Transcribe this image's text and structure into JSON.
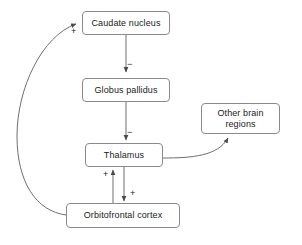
{
  "diagram": {
    "background_color": "#ffffff",
    "line_color": "#6f6f6f",
    "box_border_color": "#8a8a8a",
    "text_color": "#1a1a1a",
    "nodes": [
      {
        "id": "caudate",
        "label": "Caudate nucleus",
        "x": 82,
        "y": 11,
        "w": 88,
        "h": 24
      },
      {
        "id": "globus",
        "label": "Globus pallidus",
        "x": 82,
        "y": 78,
        "w": 88,
        "h": 24
      },
      {
        "id": "thalamus",
        "label": "Thalamus",
        "x": 85,
        "y": 143,
        "w": 78,
        "h": 24
      },
      {
        "id": "other_brain",
        "label": "Other brain\nregions",
        "x": 201,
        "y": 103,
        "w": 79,
        "h": 31
      },
      {
        "id": "orbitofrontal",
        "label": "Orbitofrontal cortex",
        "x": 66,
        "y": 203,
        "w": 114,
        "h": 25
      }
    ],
    "edges": [
      {
        "id": "caudate-to-globus",
        "from": "caudate",
        "to": "globus",
        "sign": "−",
        "sign_x": 127,
        "sign_y": 60
      },
      {
        "id": "globus-to-thalamus",
        "from": "globus",
        "to": "thalamus",
        "sign": "−",
        "sign_x": 127,
        "sign_y": 128
      },
      {
        "id": "orbitofrontal-to-thalamus",
        "from": "orbitofrontal",
        "to": "thalamus",
        "sign": "+",
        "sign_x": 103,
        "sign_y": 170
      },
      {
        "id": "thalamus-to-orbitofrontal",
        "from": "thalamus",
        "to": "orbitofrontal",
        "sign": "+",
        "sign_x": 130,
        "sign_y": 189
      },
      {
        "id": "orbitofrontal-to-caudate",
        "from": "orbitofrontal",
        "to": "caudate",
        "sign": "+",
        "sign_x": 71,
        "sign_y": 27
      },
      {
        "id": "thalamus-to-other-brain",
        "from": "thalamus",
        "to": "other_brain",
        "sign": "",
        "sign_x": 0,
        "sign_y": 0
      }
    ]
  }
}
